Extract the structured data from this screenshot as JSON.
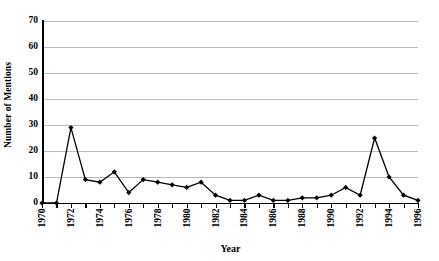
{
  "chart_data": {
    "type": "line",
    "title": "",
    "xlabel": "Year",
    "ylabel": "Number of Mentions",
    "x": [
      1970,
      1971,
      1972,
      1973,
      1974,
      1975,
      1976,
      1977,
      1978,
      1979,
      1980,
      1981,
      1982,
      1983,
      1984,
      1985,
      1986,
      1987,
      1988,
      1989,
      1990,
      1991,
      1992,
      1993,
      1994,
      1995,
      1996
    ],
    "values": [
      0,
      0,
      29,
      9,
      8,
      12,
      4,
      9,
      8,
      7,
      6,
      8,
      3,
      1,
      1,
      3,
      1,
      1,
      2,
      2,
      3,
      6,
      3,
      25,
      10,
      3,
      1
    ],
    "categories": [
      "1970",
      "1971",
      "1972",
      "1973",
      "1974",
      "1975",
      "1976",
      "1977",
      "1978",
      "1979",
      "1980",
      "1981",
      "1982",
      "1983",
      "1984",
      "1985",
      "1986",
      "1987",
      "1988",
      "1989",
      "1990",
      "1991",
      "1992",
      "1993",
      "1994",
      "1995",
      "1996"
    ],
    "xlim": [
      1970,
      1996
    ],
    "ylim": [
      0,
      70
    ],
    "yticks": [
      0,
      10,
      20,
      30,
      40,
      50,
      60,
      70
    ],
    "ytick_labels": [
      "0",
      "10",
      "20",
      "30",
      "40",
      "50",
      "60",
      "70"
    ],
    "xtick_labels": [
      "1970",
      "1972",
      "1974",
      "1976",
      "1978",
      "1980",
      "1982",
      "1984",
      "1986",
      "1988",
      "1990",
      "1992",
      "1994",
      "1996"
    ],
    "xtick_values": [
      1970,
      1972,
      1974,
      1976,
      1978,
      1980,
      1982,
      1984,
      1986,
      1988,
      1990,
      1992,
      1994,
      1996
    ],
    "grid": true,
    "grid_axis": "y",
    "legend": false,
    "legend_position": "none",
    "marker": "filled-diamond",
    "line_color": "#000000",
    "marker_color": "#000000",
    "grid_color": "#b9b9c4",
    "background_color": "#ffffff",
    "axis_color": "#000000"
  }
}
